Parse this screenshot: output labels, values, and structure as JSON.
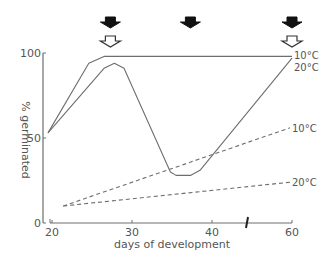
{
  "chart_data": {
    "type": "line",
    "title": "",
    "xlabel": "days of development",
    "ylabel": "% germinated",
    "xlim": [
      20,
      60
    ],
    "ylim": [
      0,
      100
    ],
    "x_axis_break_between": [
      40,
      60
    ],
    "x_ticks": [
      20,
      30,
      40,
      60
    ],
    "x_tick_labels": [
      "20",
      "30",
      "40",
      "60"
    ],
    "y_ticks": [
      0,
      50,
      100
    ],
    "y_tick_labels": [
      "0",
      "50",
      "100"
    ],
    "grid": false,
    "series": [
      {
        "name": "10°C (solid)",
        "label": "10°C",
        "style": "solid",
        "points": [
          [
            19.5,
            53
          ],
          [
            24.6,
            94
          ],
          [
            26.5,
            98
          ],
          [
            60,
            98
          ]
        ]
      },
      {
        "name": "20°C (solid)",
        "label": "20°C",
        "style": "solid",
        "points": [
          [
            19.5,
            53
          ],
          [
            26.5,
            91
          ],
          [
            27.8,
            94
          ],
          [
            29,
            91
          ],
          [
            34.8,
            30
          ],
          [
            35.5,
            28
          ],
          [
            37.3,
            28
          ],
          [
            38.5,
            31
          ],
          [
            60,
            97
          ]
        ]
      },
      {
        "name": "10°C (dashed)",
        "label": "10°C",
        "style": "dashed",
        "points": [
          [
            21.4,
            10
          ],
          [
            59.5,
            56
          ]
        ]
      },
      {
        "name": "20°C (dashed)",
        "label": "20°C",
        "style": "dashed",
        "points": [
          [
            21.4,
            10
          ],
          [
            59.5,
            24
          ]
        ]
      }
    ],
    "annotations": {
      "black_arrows_at_days": [
        27.3,
        37.3,
        60
      ],
      "white_arrows_at_days": [
        27.3,
        60
      ]
    }
  }
}
